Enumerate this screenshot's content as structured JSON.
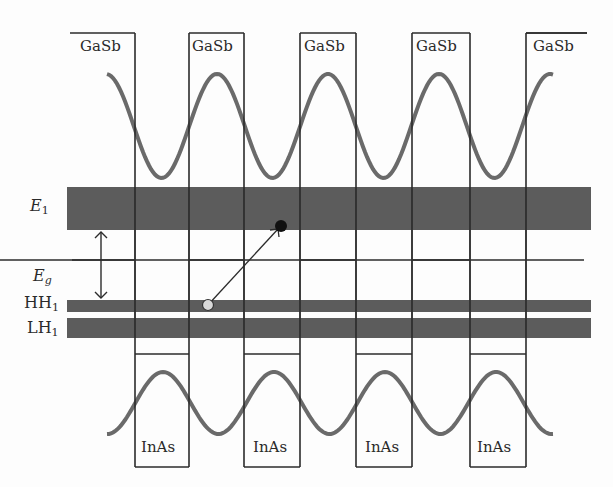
{
  "diagram": {
    "colors": {
      "band_fill": "#5c5c5c",
      "wave": "#6a6a6a",
      "line": "#2b2b2b",
      "hole": "#d8d8d8",
      "electron": "#111111",
      "background": "#fdfdfd"
    },
    "top_layers": [
      {
        "label": "GaSb",
        "x": 80
      },
      {
        "label": "GaSb",
        "x": 192
      },
      {
        "label": "GaSb",
        "x": 304
      },
      {
        "label": "GaSb",
        "x": 416
      },
      {
        "label": "GaSb",
        "x": 533
      }
    ],
    "bottom_layers": [
      {
        "label": "InAs",
        "x": 141
      },
      {
        "label": "InAs",
        "x": 253
      },
      {
        "label": "InAs",
        "x": 365
      },
      {
        "label": "InAs",
        "x": 477
      }
    ],
    "levels": {
      "E1": {
        "label": "E",
        "sub": "1"
      },
      "Eg": {
        "label": "E",
        "sub": "g"
      },
      "HH1": {
        "label": "HH",
        "sub": "1"
      },
      "LH1": {
        "label": "LH",
        "sub": "1"
      }
    },
    "geometry": {
      "walls": [
        135,
        189,
        244,
        300,
        356,
        412,
        470,
        526
      ],
      "top_edge_y": 33,
      "bottom_step_y": 354,
      "bottom_edge_y": 467,
      "e1_band": [
        67,
        187,
        591,
        230
      ],
      "hh1_band": [
        67,
        300,
        591,
        312
      ],
      "lh1_band": [
        67,
        318,
        591,
        338
      ],
      "level_line_y": 260,
      "hole": [
        208,
        305
      ],
      "electron": [
        281,
        226
      ],
      "eg_arrow": [
        101,
        230,
        300
      ]
    }
  }
}
